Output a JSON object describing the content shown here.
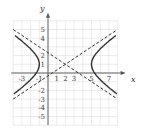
{
  "chart_data": {
    "type": "line",
    "title": "",
    "xlabel": "x",
    "ylabel": "y",
    "xlim": [
      -4,
      8
    ],
    "ylim": [
      -6,
      6
    ],
    "grid": true,
    "x_tick_labels": [
      "-3",
      "-1",
      "1",
      "2",
      "3",
      "5",
      "7"
    ],
    "y_tick_labels": [
      "5",
      "4",
      "2",
      "1",
      "-2",
      "-3",
      "-4",
      "-5"
    ],
    "series": [
      {
        "name": "hyperbola",
        "style": "solid",
        "equation": "(x-2)^2/9 - (y-1)^2/4 = 1",
        "center": [
          2,
          1
        ],
        "vertices": [
          [
            -1,
            1
          ],
          [
            5,
            1
          ]
        ]
      },
      {
        "name": "asymptote-1",
        "style": "dashed",
        "equation": "y - 1 = (2/3)(x - 2)"
      },
      {
        "name": "asymptote-2",
        "style": "dashed",
        "equation": "y - 1 = -(2/3)(x - 2)"
      }
    ]
  }
}
